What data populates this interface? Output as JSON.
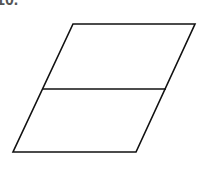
{
  "question_label": "10.",
  "diagram": {
    "shape": "parallelogram",
    "vertices": [
      [
        73,
        24
      ],
      [
        195,
        24
      ],
      [
        136,
        152
      ],
      [
        13,
        152
      ]
    ],
    "divider": {
      "from": [
        43,
        89
      ],
      "to": [
        166,
        89
      ]
    },
    "stroke": "#111111"
  }
}
